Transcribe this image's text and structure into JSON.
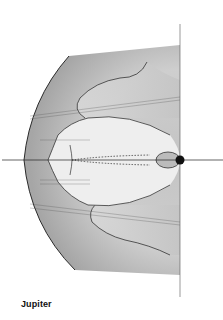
{
  "figure": {
    "caption": "Jupiter",
    "colors": {
      "outer_shade": "#a8a8a8",
      "mid_shade": "#cfcfcf",
      "inner_light": "#ececec",
      "line": "#333333",
      "planet": "#111111"
    }
  }
}
